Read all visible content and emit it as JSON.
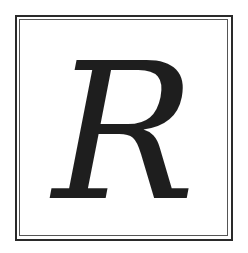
{
  "letter": "R",
  "colors": {
    "ink": "#1e1e1e",
    "frame": "#2a2a2a",
    "background": "#ffffff"
  }
}
